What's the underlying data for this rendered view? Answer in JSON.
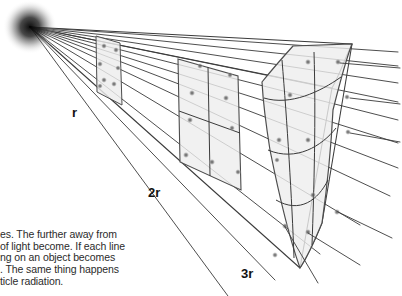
{
  "figure": {
    "name": "inverse-square-law-diagram",
    "background_color": "#ffffff",
    "line_color": "#3a3a3a",
    "panel_fill": "#ededed",
    "panel_stroke": "#555555",
    "dot_color": "#6a6a6a",
    "light_source": {
      "name": "point-light-source",
      "x": 30,
      "y": 27,
      "radius": 26,
      "color": "#1a1a1a"
    },
    "labels": {
      "r": "r",
      "two_r": "2r",
      "three_r": "3r"
    },
    "panels": [
      {
        "name": "panel-r",
        "distance_label": "r",
        "grid": 1,
        "cells": 1
      },
      {
        "name": "panel-2r",
        "distance_label": "2r",
        "grid": 2,
        "cells": 4
      },
      {
        "name": "panel-3r",
        "distance_label": "3r",
        "grid": 3,
        "cells": 9
      }
    ],
    "ray_count": 9
  },
  "caption": {
    "lines": [
      "es. The further away from",
      "of light become. If each line",
      "ng on an object becomes",
      ". The same thing happens",
      "ticle radiation."
    ]
  }
}
